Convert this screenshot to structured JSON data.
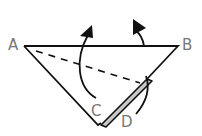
{
  "diagram": {
    "type": "origami-fold-instruction",
    "labels": {
      "A": "A",
      "B": "B",
      "C": "C",
      "D": "D"
    },
    "colors": {
      "line": "#111111",
      "label": "#777777",
      "flap_fill": "#c8c8c8",
      "background": "#ffffff"
    },
    "elements": [
      {
        "name": "triangle",
        "desc": "inverted triangle with top edge A-B"
      },
      {
        "name": "dashed-fold-line",
        "desc": "dashed line from A toward edge near D"
      },
      {
        "name": "gray-flap",
        "desc": "narrow gray strip along right lower edge"
      },
      {
        "name": "arrow-left",
        "desc": "curved arrow from C upward past top edge"
      },
      {
        "name": "arrow-right",
        "desc": "curved arrow from D upward past top edge"
      }
    ]
  }
}
